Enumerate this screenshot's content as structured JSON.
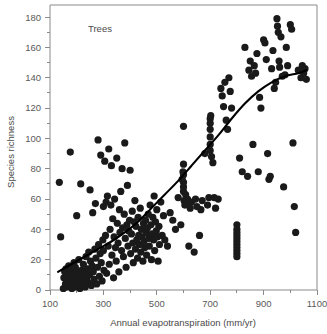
{
  "chart_data": {
    "type": "scatter",
    "title": "",
    "panel_label": "Trees",
    "xlabel": "Annual evapotranspiration (mm/yr)",
    "ylabel": "Species richness",
    "xlim": [
      100,
      1100
    ],
    "ylim": [
      0,
      188
    ],
    "grid": false,
    "legend": "none",
    "x_major_ticks": [
      100,
      300,
      500,
      700,
      900,
      1100
    ],
    "x_major_tick_labels": [
      "100",
      "300",
      "500",
      "700",
      "900",
      "1100"
    ],
    "x_minor_ticks": [
      200,
      400,
      600,
      800,
      1000
    ],
    "y_major_ticks": [
      0,
      20,
      40,
      60,
      80,
      100,
      120,
      140,
      160,
      180
    ],
    "y_major_tick_labels": [
      "0",
      "20",
      "40",
      "60",
      "80",
      "100",
      "120",
      "140",
      "160",
      "180"
    ],
    "y_minor_ticks": [
      10,
      30,
      50,
      70,
      90,
      110,
      130,
      150,
      170
    ],
    "marker": {
      "shape": "circle",
      "color": "#1a1a1a",
      "size": 3.6
    },
    "series": [
      {
        "name": "Trees",
        "points": [
          [
            135,
            71
          ],
          [
            140,
            35
          ],
          [
            150,
            1
          ],
          [
            152,
            8
          ],
          [
            155,
            12
          ],
          [
            158,
            4
          ],
          [
            160,
            14
          ],
          [
            162,
            2
          ],
          [
            165,
            9
          ],
          [
            168,
            6
          ],
          [
            170,
            16
          ],
          [
            172,
            11
          ],
          [
            175,
            3
          ],
          [
            176,
            91
          ],
          [
            178,
            7
          ],
          [
            180,
            13
          ],
          [
            182,
            1
          ],
          [
            185,
            10
          ],
          [
            188,
            5
          ],
          [
            190,
            18
          ],
          [
            192,
            2
          ],
          [
            195,
            15
          ],
          [
            198,
            8
          ],
          [
            200,
            49
          ],
          [
            202,
            12
          ],
          [
            205,
            4
          ],
          [
            208,
            20
          ],
          [
            210,
            7
          ],
          [
            212,
            1
          ],
          [
            215,
            70
          ],
          [
            218,
            13
          ],
          [
            220,
            9
          ],
          [
            222,
            3
          ],
          [
            225,
            17
          ],
          [
            228,
            6
          ],
          [
            230,
            11
          ],
          [
            232,
            2
          ],
          [
            235,
            22
          ],
          [
            238,
            8
          ],
          [
            240,
            14
          ],
          [
            242,
            5
          ],
          [
            245,
            25
          ],
          [
            248,
            10
          ],
          [
            250,
            66
          ],
          [
            252,
            19
          ],
          [
            255,
            3
          ],
          [
            258,
            16
          ],
          [
            260,
            51
          ],
          [
            262,
            12
          ],
          [
            265,
            7
          ],
          [
            268,
            27
          ],
          [
            270,
            57
          ],
          [
            272,
            21
          ],
          [
            275,
            4
          ],
          [
            278,
            15
          ],
          [
            280,
            99
          ],
          [
            282,
            30
          ],
          [
            285,
            9
          ],
          [
            288,
            24
          ],
          [
            290,
            89
          ],
          [
            292,
            18
          ],
          [
            295,
            6
          ],
          [
            298,
            33
          ],
          [
            300,
            55
          ],
          [
            300,
            26
          ],
          [
            302,
            13
          ],
          [
            305,
            85
          ],
          [
            308,
            36
          ],
          [
            310,
            58
          ],
          [
            312,
            11
          ],
          [
            315,
            62
          ],
          [
            318,
            29
          ],
          [
            320,
            93
          ],
          [
            322,
            17
          ],
          [
            325,
            40
          ],
          [
            328,
            56
          ],
          [
            330,
            82
          ],
          [
            332,
            23
          ],
          [
            335,
            47
          ],
          [
            338,
            8
          ],
          [
            340,
            35
          ],
          [
            342,
            60
          ],
          [
            345,
            28
          ],
          [
            348,
            19
          ],
          [
            350,
            87
          ],
          [
            352,
            44
          ],
          [
            355,
            31
          ],
          [
            358,
            12
          ],
          [
            360,
            53
          ],
          [
            362,
            38
          ],
          [
            365,
            65
          ],
          [
            368,
            26
          ],
          [
            370,
            80
          ],
          [
            372,
            41
          ],
          [
            375,
            22
          ],
          [
            378,
            50
          ],
          [
            380,
            97
          ],
          [
            382,
            34
          ],
          [
            385,
            15
          ],
          [
            388,
            43
          ],
          [
            390,
            69
          ],
          [
            392,
            29
          ],
          [
            395,
            39
          ],
          [
            398,
            46
          ],
          [
            400,
            79
          ],
          [
            402,
            24
          ],
          [
            405,
            37
          ],
          [
            408,
            52
          ],
          [
            410,
            31
          ],
          [
            412,
            18
          ],
          [
            415,
            45
          ],
          [
            418,
            59
          ],
          [
            420,
            27
          ],
          [
            422,
            42
          ],
          [
            425,
            33
          ],
          [
            428,
            21
          ],
          [
            430,
            48
          ],
          [
            432,
            36
          ],
          [
            435,
            30
          ],
          [
            438,
            54
          ],
          [
            440,
            25
          ],
          [
            442,
            40
          ],
          [
            445,
            35
          ],
          [
            448,
            19
          ],
          [
            450,
            44
          ],
          [
            452,
            32
          ],
          [
            455,
            28
          ],
          [
            458,
            46
          ],
          [
            460,
            38
          ],
          [
            462,
            23
          ],
          [
            465,
            41
          ],
          [
            468,
            50
          ],
          [
            470,
            34
          ],
          [
            472,
            29
          ],
          [
            475,
            56
          ],
          [
            478,
            43
          ],
          [
            480,
            20
          ],
          [
            482,
            37
          ],
          [
            485,
            48
          ],
          [
            488,
            33
          ],
          [
            490,
            62
          ],
          [
            492,
            26
          ],
          [
            495,
            45
          ],
          [
            498,
            39
          ],
          [
            500,
            53
          ],
          [
            502,
            35
          ],
          [
            505,
            19
          ],
          [
            508,
            42
          ],
          [
            510,
            30
          ],
          [
            515,
            58
          ],
          [
            520,
            36
          ],
          [
            525,
            49
          ],
          [
            530,
            33
          ],
          [
            540,
            29
          ],
          [
            550,
            51
          ],
          [
            560,
            46
          ],
          [
            570,
            40
          ],
          [
            580,
            61
          ],
          [
            590,
            43
          ],
          [
            595,
            73
          ],
          [
            598,
            78
          ],
          [
            600,
            108
          ],
          [
            600,
            83
          ],
          [
            600,
            76
          ],
          [
            600,
            71
          ],
          [
            600,
            68
          ],
          [
            600,
            65
          ],
          [
            602,
            59
          ],
          [
            605,
            56
          ],
          [
            608,
            63
          ],
          [
            610,
            57
          ],
          [
            615,
            60
          ],
          [
            620,
            29
          ],
          [
            625,
            54
          ],
          [
            630,
            58
          ],
          [
            640,
            25
          ],
          [
            645,
            60
          ],
          [
            650,
            55
          ],
          [
            660,
            36
          ],
          [
            665,
            53
          ],
          [
            670,
            59
          ],
          [
            680,
            90
          ],
          [
            690,
            56
          ],
          [
            695,
            61
          ],
          [
            700,
            113
          ],
          [
            700,
            110
          ],
          [
            700,
            106
          ],
          [
            700,
            101
          ],
          [
            700,
            96
          ],
          [
            700,
            92
          ],
          [
            702,
            115
          ],
          [
            705,
            88
          ],
          [
            710,
            84
          ],
          [
            715,
            61
          ],
          [
            720,
            54
          ],
          [
            730,
            60
          ],
          [
            740,
            133
          ],
          [
            745,
            128
          ],
          [
            750,
            121
          ],
          [
            755,
            137
          ],
          [
            760,
            112
          ],
          [
            765,
            106
          ],
          [
            770,
            140
          ],
          [
            775,
            131
          ],
          [
            780,
            120
          ],
          [
            800,
            43
          ],
          [
            800,
            40
          ],
          [
            800,
            38
          ],
          [
            800,
            36
          ],
          [
            800,
            34
          ],
          [
            800,
            32
          ],
          [
            800,
            30
          ],
          [
            800,
            28
          ],
          [
            800,
            26
          ],
          [
            800,
            24
          ],
          [
            800,
            22
          ],
          [
            810,
            87
          ],
          [
            820,
            78
          ],
          [
            830,
            160
          ],
          [
            840,
            75
          ],
          [
            845,
            145
          ],
          [
            850,
            151
          ],
          [
            855,
            141
          ],
          [
            860,
            96
          ],
          [
            865,
            148
          ],
          [
            870,
            143
          ],
          [
            875,
            156
          ],
          [
            880,
            78
          ],
          [
            885,
            127
          ],
          [
            890,
            120
          ],
          [
            900,
            165
          ],
          [
            905,
            163
          ],
          [
            910,
            152
          ],
          [
            915,
            90
          ],
          [
            920,
            73
          ],
          [
            925,
            75
          ],
          [
            930,
            146
          ],
          [
            935,
            158
          ],
          [
            940,
            133
          ],
          [
            945,
            137
          ],
          [
            950,
            179
          ],
          [
            952,
            174
          ],
          [
            955,
            170
          ],
          [
            958,
            151
          ],
          [
            960,
            147
          ],
          [
            965,
            167
          ],
          [
            970,
            141
          ],
          [
            975,
            68
          ],
          [
            980,
            142
          ],
          [
            985,
            160
          ],
          [
            990,
            148
          ],
          [
            1000,
            175
          ],
          [
            1005,
            172
          ],
          [
            1010,
            97
          ],
          [
            1015,
            55
          ],
          [
            1020,
            38
          ],
          [
            1030,
            145
          ],
          [
            1040,
            140
          ],
          [
            1045,
            148
          ],
          [
            1050,
            143
          ],
          [
            1055,
            146
          ],
          [
            1060,
            139
          ]
        ]
      }
    ],
    "fit_curve": {
      "name": "smoothed fit",
      "color": "#000000",
      "points": [
        [
          130,
          12
        ],
        [
          180,
          17
        ],
        [
          230,
          22
        ],
        [
          280,
          27
        ],
        [
          330,
          32
        ],
        [
          380,
          38
        ],
        [
          430,
          45
        ],
        [
          480,
          54
        ],
        [
          530,
          63
        ],
        [
          580,
          72
        ],
        [
          630,
          82
        ],
        [
          680,
          92
        ],
        [
          730,
          102
        ],
        [
          780,
          113
        ],
        [
          830,
          123
        ],
        [
          880,
          131
        ],
        [
          930,
          137
        ],
        [
          980,
          141
        ],
        [
          1030,
          143
        ],
        [
          1060,
          145
        ]
      ]
    }
  }
}
